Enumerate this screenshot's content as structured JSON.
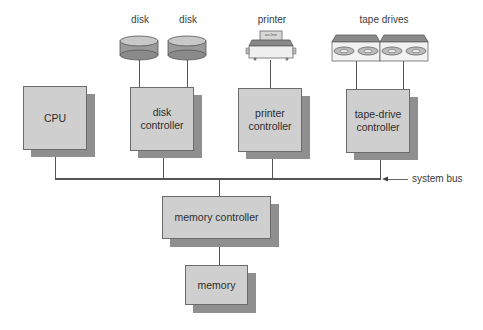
{
  "diagram": {
    "type": "computer system block diagram",
    "devices": [
      {
        "id": "disk1",
        "label": "disk"
      },
      {
        "id": "disk2",
        "label": "disk"
      },
      {
        "id": "printer",
        "label": "printer",
        "panel_text": "on-line"
      },
      {
        "id": "tape",
        "label": "tape drives"
      }
    ],
    "nodes": {
      "cpu": "CPU",
      "disk_controller": [
        "disk",
        "controller"
      ],
      "printer_controller": [
        "printer",
        "controller"
      ],
      "tape_controller": [
        "tape-drive",
        "controller"
      ],
      "memory_controller": "memory controller",
      "memory": "memory"
    },
    "bus_label": "system bus",
    "edges": [
      [
        "disk1",
        "disk_controller"
      ],
      [
        "disk2",
        "disk_controller"
      ],
      [
        "printer",
        "printer_controller"
      ],
      [
        "tape",
        "tape_controller"
      ],
      [
        "cpu",
        "system_bus"
      ],
      [
        "disk_controller",
        "system_bus"
      ],
      [
        "printer_controller",
        "system_bus"
      ],
      [
        "tape_controller",
        "system_bus"
      ],
      [
        "system_bus",
        "memory_controller"
      ],
      [
        "memory_controller",
        "memory"
      ]
    ],
    "colors": {
      "box_fill": "#cfcfcf",
      "shadow": "#8f8f8f",
      "line": "#555555"
    }
  }
}
